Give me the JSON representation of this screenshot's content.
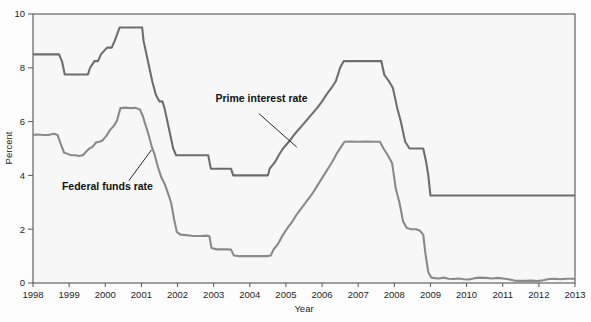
{
  "chart_data": {
    "type": "line",
    "title": "",
    "xlabel": "Year",
    "ylabel": "Percent",
    "xlim": [
      1998,
      2013
    ],
    "ylim": [
      0,
      10
    ],
    "grid": false,
    "legend_position": "inline-annotations",
    "x_ticks": [
      "1998",
      "1999",
      "2000",
      "2001",
      "2002",
      "2003",
      "2004",
      "2005",
      "2006",
      "2007",
      "2008",
      "2009",
      "2010",
      "2011",
      "2012",
      "2013"
    ],
    "y_ticks": [
      "0",
      "2",
      "4",
      "6",
      "8",
      "10"
    ],
    "series": [
      {
        "name": "Prime interest rate",
        "color": "#6e6e6e",
        "label_x": 2003.05,
        "label_y": 6.72,
        "leader_from": [
          2004.25,
          6.3
        ],
        "leader_to": [
          2005.3,
          5.05
        ],
        "points": [
          [
            1998.0,
            8.5
          ],
          [
            1998.5,
            8.5
          ],
          [
            1998.72,
            8.5
          ],
          [
            1998.8,
            8.25
          ],
          [
            1998.88,
            7.75
          ],
          [
            1999.0,
            7.75
          ],
          [
            1999.3,
            7.75
          ],
          [
            1999.52,
            7.75
          ],
          [
            1999.58,
            8.0
          ],
          [
            1999.7,
            8.25
          ],
          [
            1999.8,
            8.25
          ],
          [
            1999.88,
            8.5
          ],
          [
            2000.05,
            8.75
          ],
          [
            2000.18,
            8.75
          ],
          [
            2000.26,
            9.0
          ],
          [
            2000.4,
            9.5
          ],
          [
            2000.55,
            9.5
          ],
          [
            2000.75,
            9.5
          ],
          [
            2000.95,
            9.5
          ],
          [
            2001.02,
            9.5
          ],
          [
            2001.06,
            9.0
          ],
          [
            2001.14,
            8.5
          ],
          [
            2001.22,
            8.0
          ],
          [
            2001.3,
            7.5
          ],
          [
            2001.4,
            7.0
          ],
          [
            2001.5,
            6.75
          ],
          [
            2001.58,
            6.75
          ],
          [
            2001.64,
            6.5
          ],
          [
            2001.72,
            6.0
          ],
          [
            2001.8,
            5.5
          ],
          [
            2001.88,
            5.0
          ],
          [
            2001.96,
            4.75
          ],
          [
            2002.1,
            4.75
          ],
          [
            2002.4,
            4.75
          ],
          [
            2002.7,
            4.75
          ],
          [
            2002.85,
            4.75
          ],
          [
            2002.92,
            4.25
          ],
          [
            2003.1,
            4.25
          ],
          [
            2003.3,
            4.25
          ],
          [
            2003.48,
            4.25
          ],
          [
            2003.54,
            4.0
          ],
          [
            2003.8,
            4.0
          ],
          [
            2004.2,
            4.0
          ],
          [
            2004.5,
            4.0
          ],
          [
            2004.55,
            4.25
          ],
          [
            2004.7,
            4.5
          ],
          [
            2004.8,
            4.75
          ],
          [
            2004.92,
            5.0
          ],
          [
            2005.08,
            5.25
          ],
          [
            2005.22,
            5.5
          ],
          [
            2005.38,
            5.75
          ],
          [
            2005.54,
            6.0
          ],
          [
            2005.7,
            6.25
          ],
          [
            2005.86,
            6.5
          ],
          [
            2006.0,
            6.75
          ],
          [
            2006.12,
            7.0
          ],
          [
            2006.26,
            7.25
          ],
          [
            2006.38,
            7.5
          ],
          [
            2006.5,
            8.0
          ],
          [
            2006.6,
            8.25
          ],
          [
            2006.8,
            8.25
          ],
          [
            2007.0,
            8.25
          ],
          [
            2007.3,
            8.25
          ],
          [
            2007.55,
            8.25
          ],
          [
            2007.64,
            8.25
          ],
          [
            2007.72,
            7.75
          ],
          [
            2007.85,
            7.5
          ],
          [
            2007.96,
            7.25
          ],
          [
            2008.08,
            6.5
          ],
          [
            2008.18,
            6.0
          ],
          [
            2008.3,
            5.25
          ],
          [
            2008.42,
            5.0
          ],
          [
            2008.52,
            5.0
          ],
          [
            2008.72,
            5.0
          ],
          [
            2008.8,
            5.0
          ],
          [
            2008.88,
            4.5
          ],
          [
            2008.94,
            4.0
          ],
          [
            2009.0,
            3.25
          ],
          [
            2009.2,
            3.25
          ],
          [
            2009.6,
            3.25
          ],
          [
            2010.0,
            3.25
          ],
          [
            2010.5,
            3.25
          ],
          [
            2011.0,
            3.25
          ],
          [
            2011.5,
            3.25
          ],
          [
            2012.0,
            3.25
          ],
          [
            2012.5,
            3.25
          ],
          [
            2013.0,
            3.25
          ]
        ]
      },
      {
        "name": "Federal funds rate",
        "color": "#8a8a8a",
        "label_x": 1998.8,
        "label_y": 3.45,
        "leader_from": [
          2000.65,
          3.8
        ],
        "leader_to": [
          2001.28,
          4.95
        ],
        "points": [
          [
            1998.0,
            5.5
          ],
          [
            1998.12,
            5.52
          ],
          [
            1998.28,
            5.5
          ],
          [
            1998.42,
            5.5
          ],
          [
            1998.58,
            5.55
          ],
          [
            1998.68,
            5.5
          ],
          [
            1998.76,
            5.2
          ],
          [
            1998.86,
            4.85
          ],
          [
            1998.96,
            4.8
          ],
          [
            1999.06,
            4.75
          ],
          [
            1999.18,
            4.75
          ],
          [
            1999.28,
            4.72
          ],
          [
            1999.38,
            4.75
          ],
          [
            1999.48,
            4.9
          ],
          [
            1999.56,
            5.0
          ],
          [
            1999.64,
            5.05
          ],
          [
            1999.74,
            5.22
          ],
          [
            1999.84,
            5.25
          ],
          [
            1999.92,
            5.3
          ],
          [
            2000.02,
            5.45
          ],
          [
            2000.14,
            5.7
          ],
          [
            2000.24,
            5.85
          ],
          [
            2000.32,
            6.02
          ],
          [
            2000.42,
            6.5
          ],
          [
            2000.56,
            6.52
          ],
          [
            2000.7,
            6.5
          ],
          [
            2000.84,
            6.51
          ],
          [
            2000.96,
            6.45
          ],
          [
            2001.04,
            6.2
          ],
          [
            2001.12,
            5.85
          ],
          [
            2001.2,
            5.5
          ],
          [
            2001.28,
            5.1
          ],
          [
            2001.36,
            4.8
          ],
          [
            2001.46,
            4.3
          ],
          [
            2001.56,
            3.9
          ],
          [
            2001.64,
            3.7
          ],
          [
            2001.72,
            3.4
          ],
          [
            2001.82,
            3.0
          ],
          [
            2001.9,
            2.4
          ],
          [
            2001.98,
            1.9
          ],
          [
            2002.08,
            1.8
          ],
          [
            2002.24,
            1.78
          ],
          [
            2002.44,
            1.75
          ],
          [
            2002.64,
            1.75
          ],
          [
            2002.8,
            1.76
          ],
          [
            2002.88,
            1.75
          ],
          [
            2002.94,
            1.3
          ],
          [
            2003.08,
            1.25
          ],
          [
            2003.24,
            1.25
          ],
          [
            2003.38,
            1.25
          ],
          [
            2003.48,
            1.24
          ],
          [
            2003.56,
            1.02
          ],
          [
            2003.7,
            1.0
          ],
          [
            2003.9,
            1.0
          ],
          [
            2004.1,
            1.0
          ],
          [
            2004.3,
            1.0
          ],
          [
            2004.48,
            1.0
          ],
          [
            2004.58,
            1.02
          ],
          [
            2004.66,
            1.25
          ],
          [
            2004.78,
            1.45
          ],
          [
            2004.9,
            1.75
          ],
          [
            2005.02,
            2.0
          ],
          [
            2005.16,
            2.25
          ],
          [
            2005.3,
            2.55
          ],
          [
            2005.44,
            2.8
          ],
          [
            2005.58,
            3.05
          ],
          [
            2005.72,
            3.3
          ],
          [
            2005.86,
            3.6
          ],
          [
            2006.0,
            3.9
          ],
          [
            2006.14,
            4.2
          ],
          [
            2006.28,
            4.5
          ],
          [
            2006.4,
            4.8
          ],
          [
            2006.52,
            5.05
          ],
          [
            2006.62,
            5.25
          ],
          [
            2006.8,
            5.26
          ],
          [
            2007.0,
            5.25
          ],
          [
            2007.24,
            5.26
          ],
          [
            2007.48,
            5.25
          ],
          [
            2007.6,
            5.25
          ],
          [
            2007.7,
            5.0
          ],
          [
            2007.82,
            4.75
          ],
          [
            2007.94,
            4.45
          ],
          [
            2008.04,
            3.5
          ],
          [
            2008.14,
            3.0
          ],
          [
            2008.24,
            2.3
          ],
          [
            2008.34,
            2.05
          ],
          [
            2008.46,
            2.0
          ],
          [
            2008.6,
            2.0
          ],
          [
            2008.7,
            1.95
          ],
          [
            2008.8,
            1.8
          ],
          [
            2008.86,
            1.1
          ],
          [
            2008.94,
            0.4
          ],
          [
            2009.02,
            0.2
          ],
          [
            2009.12,
            0.18
          ],
          [
            2009.24,
            0.17
          ],
          [
            2009.36,
            0.2
          ],
          [
            2009.5,
            0.16
          ],
          [
            2009.64,
            0.15
          ],
          [
            2009.78,
            0.17
          ],
          [
            2009.92,
            0.14
          ],
          [
            2010.06,
            0.13
          ],
          [
            2010.22,
            0.18
          ],
          [
            2010.38,
            0.2
          ],
          [
            2010.54,
            0.19
          ],
          [
            2010.7,
            0.17
          ],
          [
            2010.86,
            0.19
          ],
          [
            2011.0,
            0.17
          ],
          [
            2011.16,
            0.14
          ],
          [
            2011.32,
            0.09
          ],
          [
            2011.48,
            0.08
          ],
          [
            2011.64,
            0.08
          ],
          [
            2011.8,
            0.09
          ],
          [
            2011.96,
            0.07
          ],
          [
            2012.12,
            0.1
          ],
          [
            2012.28,
            0.15
          ],
          [
            2012.44,
            0.16
          ],
          [
            2012.6,
            0.14
          ],
          [
            2012.76,
            0.16
          ],
          [
            2012.92,
            0.16
          ],
          [
            2013.0,
            0.15
          ]
        ]
      }
    ]
  },
  "colors": {
    "plot_background": "#f7f7f7",
    "frame": "#555555",
    "prime_line": "#6e6e6e",
    "fedfunds_line": "#8a8a8a",
    "text": "#1d1d1d"
  }
}
